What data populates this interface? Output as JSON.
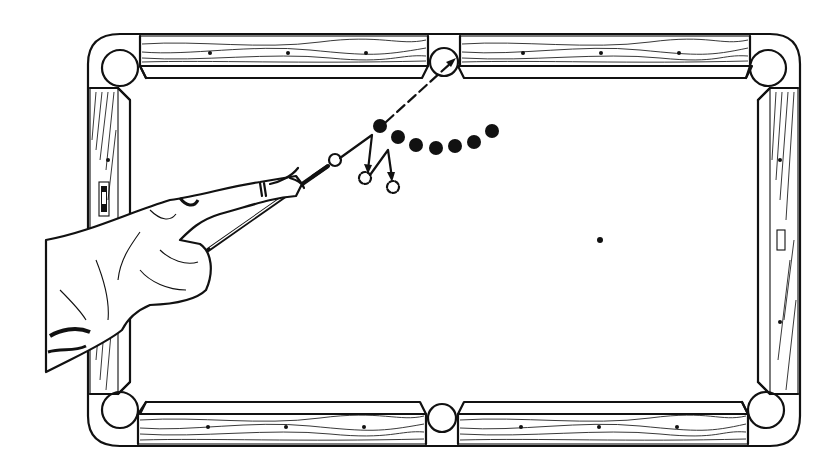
{
  "figure": {
    "colors": {
      "ink": "#111111",
      "paper": "#ffffff"
    }
  },
  "table": {
    "pockets": [
      "top-left",
      "top-middle",
      "top-right",
      "bottom-left",
      "bottom-middle",
      "bottom-right"
    ],
    "diamonds_per_long_rail_segment": 3,
    "diamonds_per_short_rail": 3
  },
  "shot": {
    "cue_ball": "white",
    "object_balls_count": 7,
    "ghost_balls_count": 2,
    "aim_target": "top-middle pocket",
    "spot_marker": "foot spot"
  }
}
